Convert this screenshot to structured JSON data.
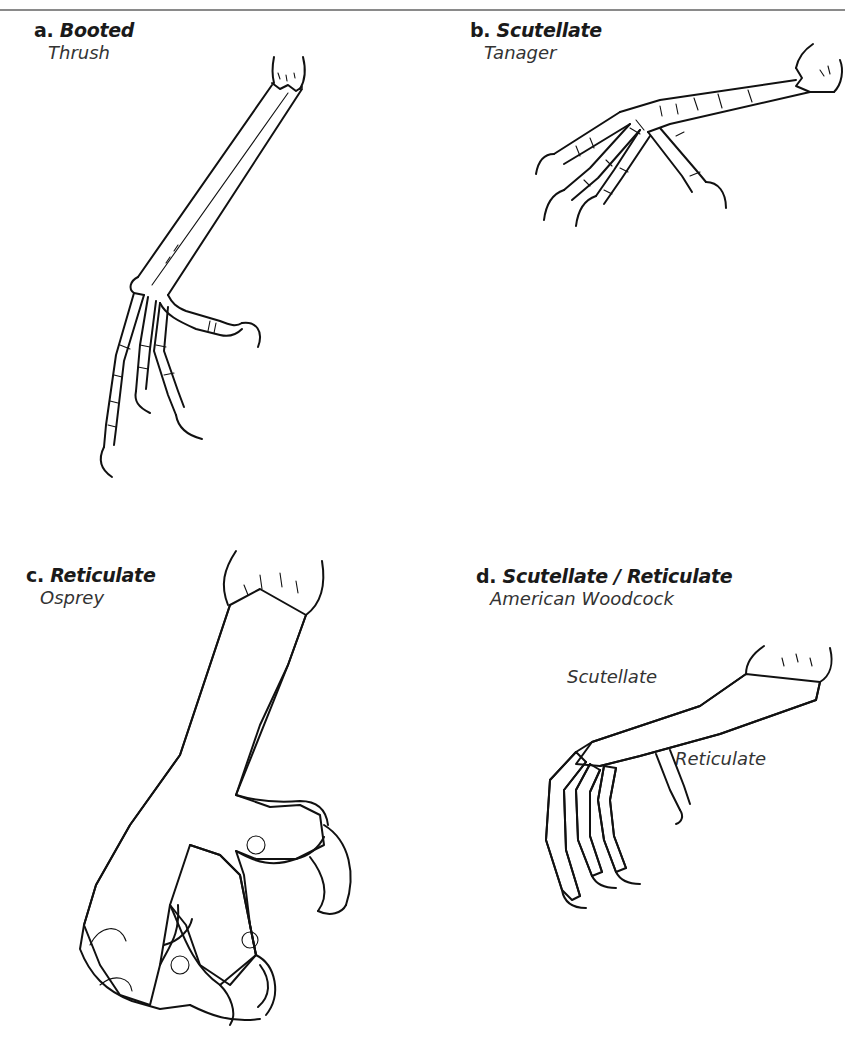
{
  "page": {
    "figures": [
      {
        "id": "a",
        "letter": "a.",
        "title": "Booted",
        "species": "Thrush"
      },
      {
        "id": "b",
        "letter": "b.",
        "title": "Scutellate",
        "species": "Tanager"
      },
      {
        "id": "c",
        "letter": "c.",
        "title": "Reticulate",
        "species": "Osprey"
      },
      {
        "id": "d",
        "letter": "d.",
        "title": "Scutellate / Reticulate",
        "species": "American Woodcock",
        "annotations": [
          "Scutellate",
          "Reticulate"
        ]
      }
    ]
  },
  "icons": {
    "a": "booted-thrush-foot-illustration",
    "b": "scutellate-tanager-foot-illustration",
    "c": "reticulate-osprey-foot-illustration",
    "d": "woodcock-foot-illustration"
  },
  "colors": {
    "ink": "#1a1a1a",
    "rule": "#8a8a8a",
    "background": "#ffffff"
  }
}
